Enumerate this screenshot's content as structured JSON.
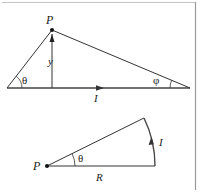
{
  "colors": {
    "background": "#ffffff",
    "line": "#333333",
    "border": "#9a9a9a",
    "text": "#222222"
  },
  "top_figure": {
    "point_label": "P",
    "height_label": "y",
    "left_angle_label": "θ",
    "right_angle_label": "φ",
    "current_label": "I",
    "vertices": {
      "left": [
        7,
        88
      ],
      "top": [
        52,
        30
      ],
      "right": [
        190,
        88
      ],
      "foot": [
        52,
        88
      ]
    }
  },
  "bottom_figure": {
    "point_label": "P",
    "angle_label": "θ",
    "radius_label": "R",
    "current_label": "I",
    "center": [
      47,
      166
    ],
    "radius_end": [
      155,
      166
    ],
    "arc_top": [
      144,
      118
    ]
  }
}
